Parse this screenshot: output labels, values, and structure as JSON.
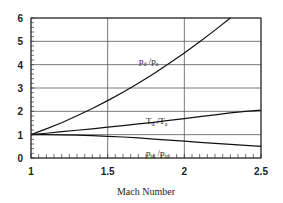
{
  "chart_data": {
    "type": "line",
    "title": "",
    "xlabel": "Mach Number",
    "ylabel": "",
    "xlim": [
      1,
      2.5
    ],
    "ylim": [
      0,
      6
    ],
    "x_ticks": [
      "1",
      "1.5",
      "2",
      "2.5"
    ],
    "y_ticks": [
      "0",
      "1",
      "2",
      "3",
      "4",
      "5",
      "6"
    ],
    "grid": true,
    "legend": "inline labels",
    "x": [
      1.0,
      1.1,
      1.2,
      1.3,
      1.4,
      1.5,
      1.6,
      1.7,
      1.8,
      1.9,
      2.0,
      2.1,
      2.2,
      2.3,
      2.4,
      2.5
    ],
    "series": [
      {
        "name": "p_d / p_a",
        "label_main": "p",
        "label_sub1": "d",
        "label_sub2": "a",
        "values": [
          1.0,
          1.25,
          1.51,
          1.81,
          2.12,
          2.46,
          2.82,
          3.2,
          3.61,
          4.05,
          4.5,
          4.98,
          5.48,
          6.0,
          null,
          null
        ]
      },
      {
        "name": "T_d / T_a",
        "label_main": "T",
        "label_sub1": "d",
        "label_sub2": "a",
        "values": [
          1.0,
          1.06,
          1.13,
          1.19,
          1.25,
          1.32,
          1.39,
          1.46,
          1.53,
          1.61,
          1.69,
          1.77,
          1.85,
          1.93,
          2.0,
          2.05
        ]
      },
      {
        "name": "p_td / p_ta",
        "label_main": "p",
        "label_sub1": "td",
        "label_sub2": "ta",
        "values": [
          1.0,
          1.0,
          0.99,
          0.98,
          0.96,
          0.93,
          0.9,
          0.86,
          0.81,
          0.77,
          0.72,
          0.67,
          0.63,
          0.58,
          0.54,
          0.5
        ]
      }
    ]
  }
}
